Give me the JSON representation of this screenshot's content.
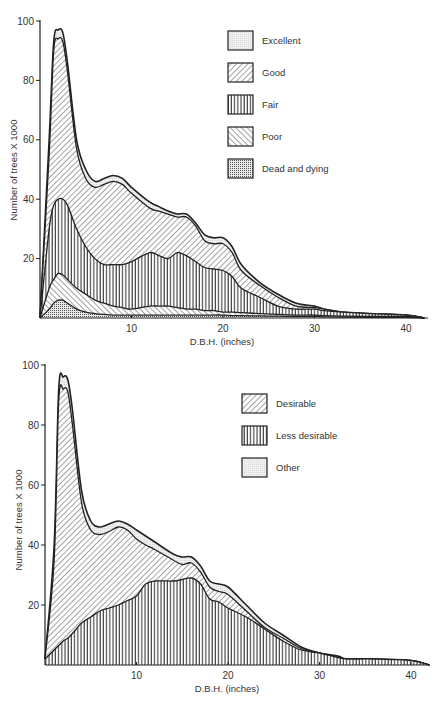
{
  "chart_data": [
    {
      "type": "area",
      "stacked": true,
      "title": "",
      "xlabel": "D.B.H. (inches)",
      "ylabel": "Number of trees X 1000",
      "xlim": [
        0,
        42
      ],
      "ylim": [
        0,
        100
      ],
      "xticks": [
        10,
        20,
        30,
        40
      ],
      "yticks": [
        20,
        40,
        60,
        80,
        100
      ],
      "grid": false,
      "legend_position": "upper right",
      "x": [
        0,
        1,
        1.5,
        2,
        2.5,
        3,
        4,
        5,
        6,
        7,
        8,
        9,
        10,
        12,
        13,
        14,
        15,
        16,
        17,
        18,
        19,
        20,
        21,
        22,
        24,
        26,
        28,
        30,
        31,
        33,
        36,
        40,
        42
      ],
      "series_cumulative_tops": [
        {
          "name": "Dead and dying",
          "pattern": "dots",
          "values": [
            0,
            3,
            5,
            6,
            6,
            5,
            3,
            2,
            1.5,
            1.2,
            1,
            1,
            1,
            1,
            1,
            1,
            1,
            1,
            1,
            1,
            1,
            1,
            0.8,
            0.8,
            0.7,
            0.6,
            0.5,
            0.5,
            0.4,
            0.3,
            0.2,
            0.2,
            0
          ]
        },
        {
          "name": "Poor",
          "pattern": "back-diagonal",
          "values": [
            0,
            10,
            13,
            15,
            14.5,
            13,
            10,
            8,
            6,
            5,
            4,
            3.5,
            3,
            4,
            4,
            4,
            3.5,
            3,
            3,
            2.5,
            2.5,
            2,
            2,
            1.8,
            1.5,
            1.2,
            1,
            1,
            0.8,
            0.6,
            0.5,
            0.5,
            0
          ]
        },
        {
          "name": "Fair",
          "pattern": "vertical",
          "values": [
            0,
            30,
            38,
            40,
            40,
            38,
            30,
            24,
            20,
            18,
            18,
            18,
            19,
            22,
            21,
            20,
            22,
            21,
            19,
            17,
            16.5,
            16,
            14,
            10,
            7,
            4,
            3,
            3,
            2.5,
            2,
            1.5,
            1,
            0
          ]
        },
        {
          "name": "Good",
          "pattern": "forward-diagonal",
          "values": [
            0,
            55,
            90,
            94,
            93,
            83,
            57,
            47,
            44,
            45,
            46,
            45,
            42,
            37,
            36,
            35,
            34,
            34,
            31,
            26,
            25,
            25,
            22,
            16,
            11,
            7,
            4,
            3.5,
            3,
            2,
            1.5,
            1,
            0
          ]
        },
        {
          "name": "Excellent",
          "pattern": "light-stipple",
          "values": [
            0,
            60,
            93,
            97,
            96,
            86,
            60,
            50,
            46,
            47,
            48,
            47,
            44,
            39,
            37.5,
            36,
            35,
            35,
            32,
            28,
            27,
            27,
            24,
            18,
            12,
            8,
            5,
            4,
            3,
            2,
            1.5,
            1,
            0
          ]
        }
      ],
      "legend": [
        "Excellent",
        "Good",
        "Fair",
        "Poor",
        "Dead and dying"
      ]
    },
    {
      "type": "area",
      "stacked": true,
      "title": "",
      "xlabel": "D.B.H. (inches)",
      "ylabel": "Number of trees X 1000",
      "xlim": [
        0,
        42
      ],
      "ylim": [
        0,
        100
      ],
      "xticks": [
        10,
        20,
        30,
        40
      ],
      "yticks": [
        20,
        40,
        60,
        80,
        100
      ],
      "grid": false,
      "legend_position": "right",
      "x": [
        0,
        1,
        1.5,
        2,
        2.5,
        3,
        4,
        5,
        6,
        7,
        8,
        9,
        10,
        11,
        12,
        14,
        15,
        16,
        17,
        18,
        19,
        20,
        22,
        24,
        26,
        28,
        30,
        32,
        33,
        36,
        40,
        42
      ],
      "series_cumulative_tops": [
        {
          "name": "Less desirable",
          "pattern": "vertical",
          "values": [
            2,
            5,
            6.5,
            8,
            9,
            10.5,
            14,
            16,
            18,
            19,
            20,
            21.5,
            23,
            27,
            28,
            28,
            28.5,
            29,
            27,
            22,
            21,
            19,
            16,
            12,
            8,
            5,
            4,
            2.5,
            2,
            2,
            1.5,
            0
          ]
        },
        {
          "name": "Desirable",
          "pattern": "forward-diagonal",
          "values": [
            2,
            35,
            88,
            92,
            91,
            80,
            54,
            45,
            43.5,
            44.5,
            46,
            45,
            42,
            40,
            38.5,
            35,
            33.5,
            34,
            31,
            26,
            24.5,
            23.5,
            18,
            12.5,
            9,
            5.5,
            4,
            2.5,
            2,
            2,
            1.5,
            0
          ]
        },
        {
          "name": "Other",
          "pattern": "light-stipple",
          "values": [
            2,
            40,
            92,
            96,
            95,
            85,
            58,
            48,
            46,
            47,
            48,
            47,
            45,
            43,
            41,
            37,
            36,
            36,
            33,
            28,
            27,
            26,
            20,
            14,
            10,
            6,
            4,
            3,
            2,
            2,
            1.5,
            0
          ]
        }
      ],
      "legend": [
        "Desirable",
        "Less desirable",
        "Other"
      ]
    }
  ],
  "charts": [
    {
      "ylabel": "Number of trees X 1000",
      "xlabel": "D.B.H. (inches)",
      "yticks": [
        "20",
        "40",
        "60",
        "80",
        "100"
      ],
      "xticks": [
        "10",
        "20",
        "30",
        "40"
      ],
      "legend": [
        {
          "label": "Excellent"
        },
        {
          "label": "Good"
        },
        {
          "label": "Fair"
        },
        {
          "label": "Poor"
        },
        {
          "label": "Dead and dying"
        }
      ]
    },
    {
      "ylabel": "Number of trees X 1000",
      "xlabel": "D.B.H. (inches)",
      "yticks": [
        "20",
        "40",
        "60",
        "80",
        "100"
      ],
      "xticks": [
        "10",
        "20",
        "30",
        "40"
      ],
      "legend": [
        {
          "label": "Desirable"
        },
        {
          "label": "Less desirable"
        },
        {
          "label": "Other"
        }
      ]
    }
  ]
}
